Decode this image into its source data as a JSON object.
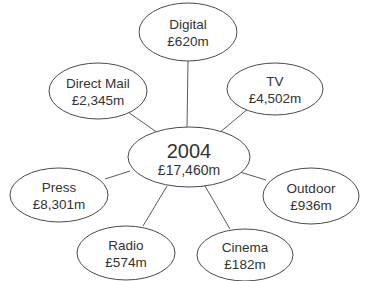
{
  "diagram": {
    "type": "spider-diagram",
    "center": {
      "title": "2004",
      "value": "£17,460m",
      "cx": 189,
      "cy": 157,
      "rx": 61,
      "ry": 30
    },
    "nodes": [
      {
        "id": "digital",
        "label": "Digital",
        "value": "£620m",
        "cx": 188,
        "cy": 32,
        "rx": 49,
        "ry": 29,
        "line": [
          188,
          61,
          187,
          127
        ]
      },
      {
        "id": "direct-mail",
        "label": "Direct Mail",
        "value": "£2,345m",
        "cx": 98,
        "cy": 91,
        "rx": 49,
        "ry": 28,
        "line": [
          125,
          110,
          158,
          133
        ]
      },
      {
        "id": "tv",
        "label": "TV",
        "value": "£4,502m",
        "cx": 275,
        "cy": 89,
        "rx": 48,
        "ry": 26,
        "line": [
          249,
          108,
          219,
          133
        ]
      },
      {
        "id": "press",
        "label": "Press",
        "value": "£8,301m",
        "cx": 59,
        "cy": 195,
        "rx": 49,
        "ry": 27,
        "line": [
          105,
          179,
          130,
          171
        ]
      },
      {
        "id": "outdoor",
        "label": "Outdoor",
        "value": "£936m",
        "cx": 311,
        "cy": 196,
        "rx": 48,
        "ry": 28,
        "line": [
          240,
          172,
          266,
          180
        ]
      },
      {
        "id": "radio",
        "label": "Radio",
        "value": "£574m",
        "cx": 126,
        "cy": 253,
        "rx": 49,
        "ry": 27,
        "line": [
          167,
          186,
          143,
          226
        ]
      },
      {
        "id": "cinema",
        "label": "Cinema",
        "value": "£182m",
        "cx": 245,
        "cy": 255,
        "rx": 48,
        "ry": 26,
        "line": [
          205,
          186,
          230,
          229
        ]
      }
    ]
  }
}
